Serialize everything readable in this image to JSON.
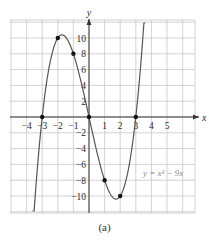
{
  "chart_data": {
    "type": "line",
    "title": "",
    "function_label": "y = x³ − 9x",
    "xlabel": "x",
    "ylabel": "y",
    "xlim": [
      -5,
      6.8
    ],
    "ylim": [
      -12,
      12
    ],
    "x_ticks": [
      -4,
      -3,
      -2,
      -1,
      1,
      2,
      3,
      4,
      5
    ],
    "x_tick_labels": [
      "−4",
      "−3",
      "−2",
      "−1",
      "1",
      "2",
      "3",
      "4",
      "5"
    ],
    "y_ticks": [
      10,
      8,
      6,
      4,
      2,
      -2,
      -4,
      -6,
      -8,
      -10
    ],
    "y_tick_labels": [
      "10",
      "8",
      "6",
      "4",
      "2",
      "−2",
      "−4",
      "−6",
      "−8",
      "−10"
    ],
    "grid": true,
    "points": [
      {
        "x": -3,
        "y": 0
      },
      {
        "x": -2,
        "y": 10
      },
      {
        "x": -1,
        "y": 8
      },
      {
        "x": 0,
        "y": 0
      },
      {
        "x": 1,
        "y": -8
      },
      {
        "x": 2,
        "y": -10
      },
      {
        "x": 3,
        "y": 0
      }
    ],
    "curve_domain": [
      -3.6,
      3.6
    ]
  },
  "caption": "(a)",
  "colors": {
    "grid": "#c8c8c8",
    "axis": "#333333",
    "curve": "#555555",
    "point": "#111111",
    "function_label": "#8a8a8a"
  }
}
